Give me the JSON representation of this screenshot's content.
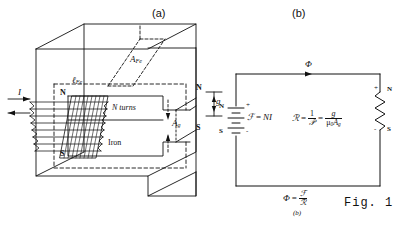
{
  "figure": {
    "caption": "Fig. 1",
    "panel_a_label": "(a)",
    "panel_b_label": "(b)",
    "panel_b_sublabel": "(b)"
  },
  "panel_a": {
    "title": "(a)",
    "description": "Iron core magnetic structure with air gap and N-turn coil",
    "labels": {
      "current": "I",
      "turns": "N turns",
      "core_material": "Iron",
      "core_area": "A",
      "core_area_sub": "Fe",
      "path_length": "ℓ",
      "path_length_sub": "Fe",
      "gap_area": "A",
      "gap_area_sub": "g",
      "gap_length": "g",
      "north_pole_coil": "N",
      "south_pole_coil": "S",
      "north_pole_gap": "N",
      "south_pole_gap": "S"
    }
  },
  "panel_b": {
    "title": "(b)",
    "description": "Equivalent magnetic circuit",
    "labels": {
      "flux": "Φ",
      "source_north": "N",
      "source_south": "S",
      "source_plus": "+",
      "source_minus": "-",
      "load_north": "N",
      "load_south": "S",
      "load_plus": "+",
      "load_minus": "-"
    },
    "equations": {
      "mmf": {
        "lhs": "ℱ",
        "eq": "=",
        "rhs": "NI"
      },
      "reluctance": {
        "lhs": "ℛ",
        "eq1": "=",
        "frac1_num": "1",
        "frac1_den": "𝒫",
        "eq2": "=",
        "frac2_num": "g",
        "frac2_den_mu": "μ",
        "frac2_den_mu_sub": "0",
        "frac2_den_a": "A",
        "frac2_den_a_sub": "g"
      },
      "flux_law": {
        "lhs": "Φ",
        "eq": "=",
        "num": "ℱ",
        "den": "ℛ"
      }
    }
  },
  "colors": {
    "ink": "#111111",
    "paper": "#ffffff"
  }
}
